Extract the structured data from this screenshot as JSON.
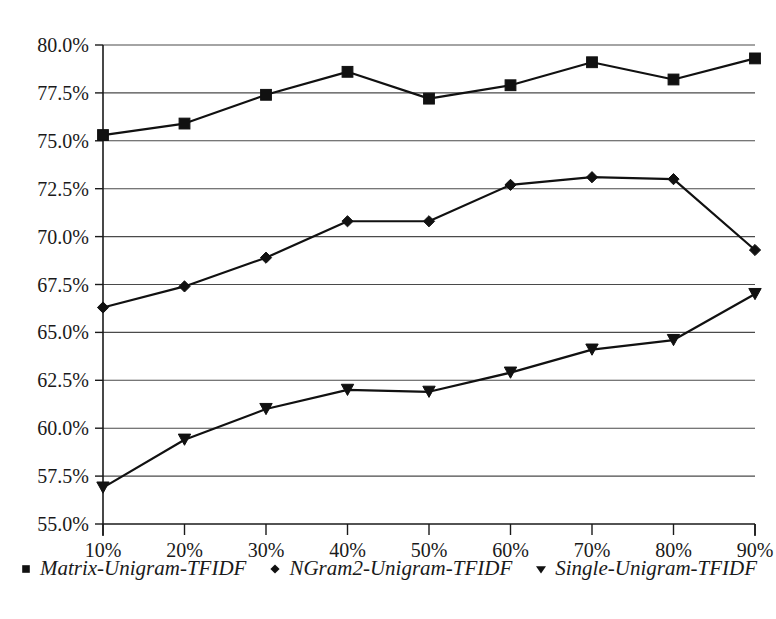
{
  "chart_data": {
    "type": "line",
    "title": "",
    "subtitle": "",
    "xlabel": "",
    "ylabel": "",
    "categories": [
      "10%",
      "20%",
      "30%",
      "40%",
      "50%",
      "60%",
      "70%",
      "80%",
      "90%"
    ],
    "ylim": [
      55.0,
      80.0
    ],
    "ytick_step": 2.5,
    "ytick_labels": [
      "55.0%",
      "57.5%",
      "60.0%",
      "62.5%",
      "65.0%",
      "67.5%",
      "70.0%",
      "72.5%",
      "75.0%",
      "77.5%",
      "80.0%"
    ],
    "ytick_values": [
      55.0,
      57.5,
      60.0,
      62.5,
      65.0,
      67.5,
      70.0,
      72.5,
      75.0,
      77.5,
      80.0
    ],
    "grid": "horizontal",
    "legend_position": "bottom",
    "series": [
      {
        "name": "Matrix-Unigram-TFIDF",
        "marker": "square",
        "color": "#111111",
        "values": [
          75.3,
          75.9,
          77.4,
          78.6,
          77.2,
          77.9,
          79.1,
          78.2,
          79.3
        ]
      },
      {
        "name": "NGram2-Unigram-TFIDF",
        "marker": "diamond",
        "color": "#111111",
        "values": [
          66.3,
          67.4,
          68.9,
          70.8,
          70.8,
          72.7,
          73.1,
          73.0,
          69.3
        ]
      },
      {
        "name": "Single-Unigram-TFIDF",
        "marker": "triangle-down",
        "color": "#111111",
        "values": [
          56.9,
          59.4,
          61.0,
          62.0,
          61.9,
          62.9,
          64.1,
          64.6,
          67.0
        ]
      }
    ]
  },
  "legend": {
    "entries": [
      {
        "label": "Matrix-Unigram-TFIDF",
        "marker": "square"
      },
      {
        "label": "NGram2-Unigram-TFIDF",
        "marker": "diamond"
      },
      {
        "label": "Single-Unigram-TFIDF",
        "marker": "triangle-down"
      }
    ]
  }
}
